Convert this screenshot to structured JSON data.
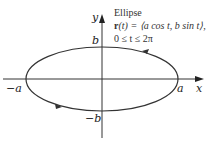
{
  "diagram": {
    "title": "Ellipse",
    "equation": "r(t) = ⟨a cos t, b sin t⟩,",
    "equation_parts": {
      "vector": "r",
      "rest": "(t) = ⟨a cos t, b sin t⟩,"
    },
    "domain": "0 ≤ t ≤ 2π",
    "axis_labels": {
      "x": "x",
      "y": "y"
    },
    "intercept_labels": {
      "pos_a": "a",
      "neg_a": "−a",
      "pos_b": "b",
      "neg_b": "−b"
    },
    "orientation": "counterclockwise",
    "colors": {
      "curve": "#333333",
      "axes": "#333333",
      "text": "#222222"
    }
  }
}
